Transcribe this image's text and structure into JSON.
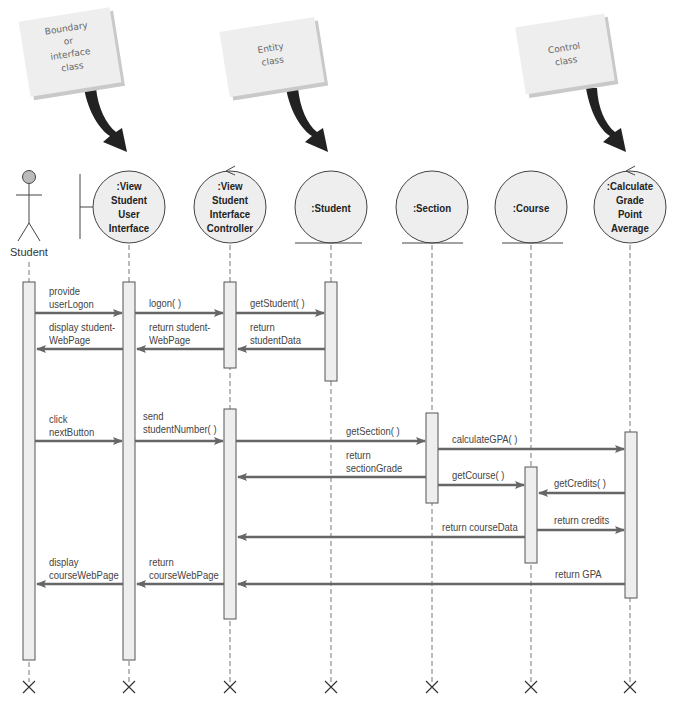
{
  "notes": [
    {
      "id": "boundary",
      "lines": [
        "Boundary",
        "or",
        "interface",
        "class"
      ]
    },
    {
      "id": "entity",
      "lines": [
        "Entity",
        "class"
      ]
    },
    {
      "id": "control",
      "lines": [
        "Control",
        "class"
      ]
    }
  ],
  "actor": {
    "label": "Student"
  },
  "objects": [
    {
      "type": "boundary",
      "lines": [
        ":View",
        "Student",
        "User",
        "Interface"
      ]
    },
    {
      "type": "control",
      "lines": [
        ":View",
        "Student",
        "Interface",
        "Controller"
      ]
    },
    {
      "type": "entity",
      "lines": [
        ":Student"
      ]
    },
    {
      "type": "entity",
      "lines": [
        ":Section"
      ]
    },
    {
      "type": "entity",
      "lines": [
        ":Course"
      ]
    },
    {
      "type": "control",
      "lines": [
        ":Calculate",
        "Grade",
        "Point",
        "Average"
      ]
    }
  ],
  "messages": [
    {
      "lines": [
        "provide",
        "userLogon"
      ],
      "from": "Student",
      "to": ":View Student User Interface"
    },
    {
      "lines": [
        "logon( )"
      ],
      "from": ":View Student User Interface",
      "to": ":View Student Interface Controller"
    },
    {
      "lines": [
        "getStudent( )"
      ],
      "from": ":View Student Interface Controller",
      "to": ":Student"
    },
    {
      "lines": [
        "return",
        "studentData"
      ],
      "from": ":Student",
      "to": ":View Student Interface Controller"
    },
    {
      "lines": [
        "return student-",
        "WebPage"
      ],
      "from": ":View Student Interface Controller",
      "to": ":View Student User Interface"
    },
    {
      "lines": [
        "display student-",
        "WebPage"
      ],
      "from": ":View Student User Interface",
      "to": "Student"
    },
    {
      "lines": [
        "click",
        "nextButton"
      ],
      "from": "Student",
      "to": ":View Student User Interface"
    },
    {
      "lines": [
        "send",
        "studentNumber( )"
      ],
      "from": ":View Student User Interface",
      "to": ":View Student Interface Controller"
    },
    {
      "lines": [
        "getSection( )"
      ],
      "from": ":View Student Interface Controller",
      "to": ":Section"
    },
    {
      "lines": [
        "calculateGPA( )"
      ],
      "from": ":Section",
      "to": ":Calculate Grade Point Average"
    },
    {
      "lines": [
        "return",
        "sectionGrade"
      ],
      "from": ":Section",
      "to": ":View Student Interface Controller"
    },
    {
      "lines": [
        "getCourse( )"
      ],
      "from": ":Section",
      "to": ":Course"
    },
    {
      "lines": [
        "getCredits( )"
      ],
      "from": ":Calculate Grade Point Average",
      "to": ":Course"
    },
    {
      "lines": [
        "return credits"
      ],
      "from": ":Course",
      "to": ":Calculate Grade Point Average"
    },
    {
      "lines": [
        "return courseData"
      ],
      "from": ":Course",
      "to": ":View Student Interface Controller"
    },
    {
      "lines": [
        "return GPA"
      ],
      "from": ":Calculate Grade Point Average",
      "to": ":View Student Interface Controller"
    },
    {
      "lines": [
        "return",
        "courseWebPage"
      ],
      "from": ":View Student Interface Controller",
      "to": ":View Student User Interface"
    },
    {
      "lines": [
        "display",
        "courseWebPage"
      ],
      "from": ":View Student User Interface",
      "to": "Student"
    }
  ],
  "colors": {
    "line": "#555555",
    "arrow": "#666666",
    "circle_fill": "#eeeeee",
    "activation_fill": "#eeeeee",
    "note_fill": "#eeeeee",
    "callout_arrow": "#222222"
  }
}
